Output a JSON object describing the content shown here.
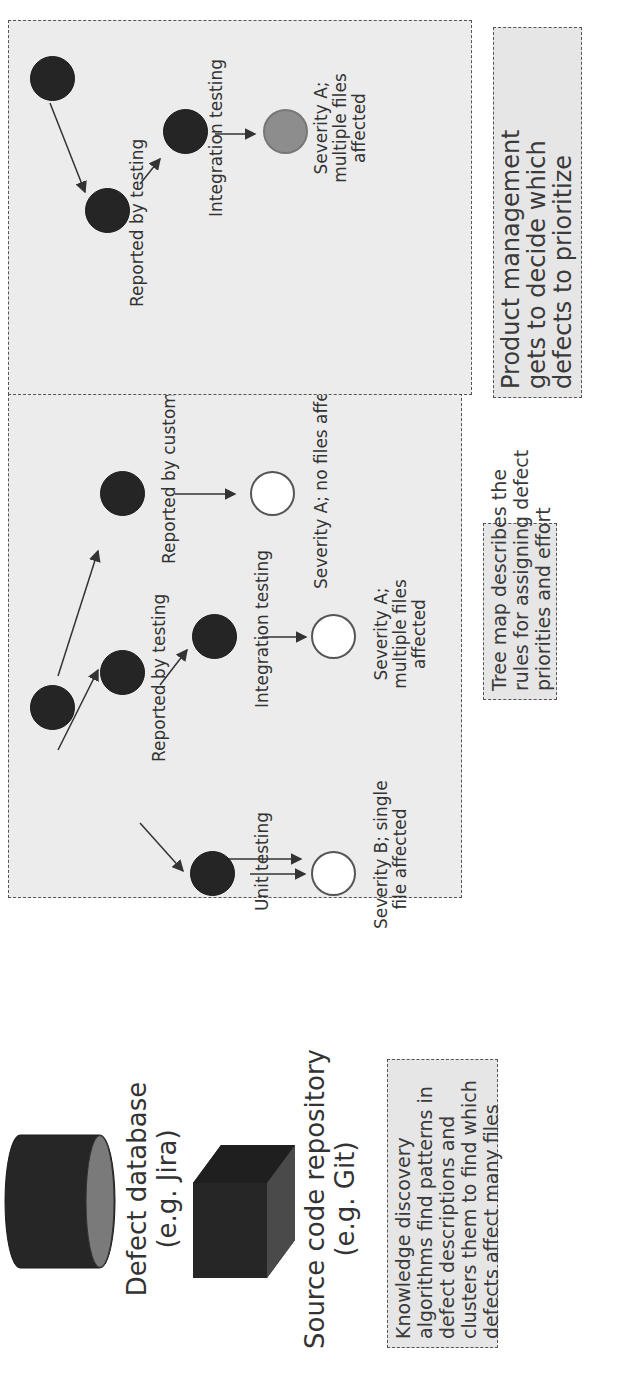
{
  "sources": {
    "defect_db": {
      "icon": "database-cylinder-icon",
      "line1": "Defect database",
      "line2": "(e.g. Jira)"
    },
    "source_repo": {
      "icon": "repository-cube-icon",
      "line1": "Source code repository",
      "line2": "(e.g. Git)"
    },
    "knowledge_note": {
      "lines": [
        "Knowledge discovery",
        "algorithms find patterns in",
        "defect descriptions and",
        "clusters them to find which",
        "defects affect many files"
      ]
    }
  },
  "tree_map": {
    "edge_labels": {
      "reported_by_testing": "Reported by testing",
      "reported_by_customer": "Reported by customer",
      "unit_testing": "Unit testing",
      "integration_testing": "Integration testing"
    },
    "leaves": {
      "severity_b_single": [
        "Severity B; single",
        "file affected"
      ],
      "severity_a_multiple": [
        "Severity A;",
        "multiple files",
        "affected"
      ],
      "severity_a_none": [
        "Severity A; no files affected"
      ]
    },
    "note": {
      "lines": [
        "Tree map describes the",
        "rules for assigning defect",
        "priorities and effort"
      ]
    }
  },
  "prioritized": {
    "edge_labels": {
      "reported_by_testing": "Reported by testing",
      "integration_testing": "Integration testing"
    },
    "leaf": [
      "Severity A;",
      "multiple files",
      "affected"
    ],
    "note": {
      "lines": [
        "Product management",
        "gets to decide which",
        "defects to prioritize"
      ]
    }
  },
  "colors": {
    "panel_bg": "#ececec",
    "node_dark": "#252525",
    "node_leaf": "#ffffff",
    "node_selected": "#8d8d8d",
    "edge": "#333333"
  }
}
